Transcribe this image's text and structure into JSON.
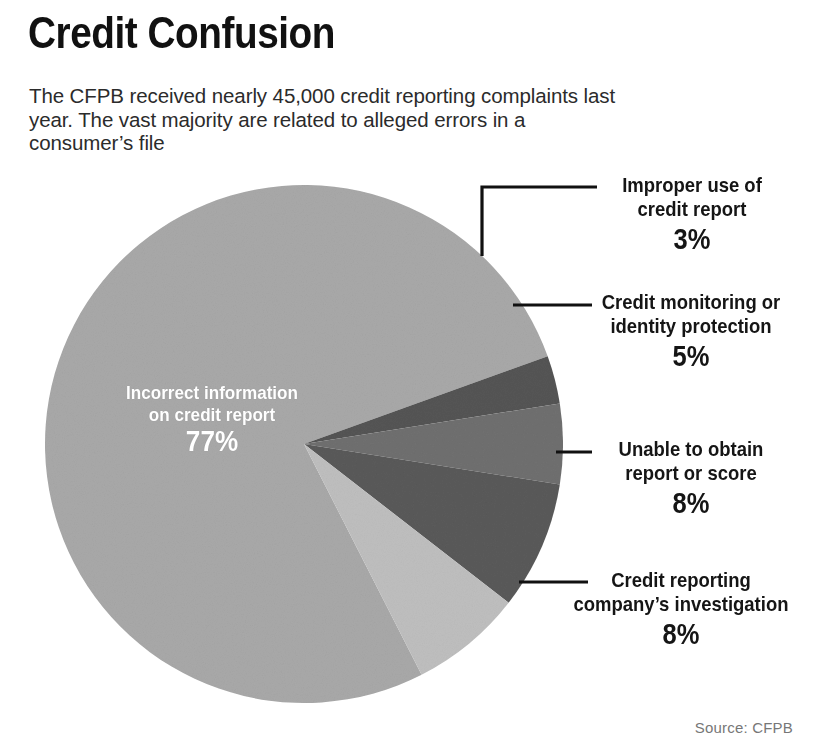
{
  "header": {
    "title": "Credit Confusion",
    "subtitle": "The CFPB received nearly 45,000 credit reporting complaints last year. The vast majority are related to alleged errors in a consumer’s file"
  },
  "source": {
    "label": "Source: CFPB"
  },
  "center_label": {
    "name": "Incorrect information on credit report",
    "value": "77%"
  },
  "callouts": [
    {
      "name": "Improper use of credit report",
      "value": "3%"
    },
    {
      "name": "Credit monitoring or identity protection",
      "value": "5%"
    },
    {
      "name": "Unable to obtain report or score",
      "value": "8%"
    },
    {
      "name": "Credit reporting company’s investigation",
      "value": "8%"
    }
  ],
  "chart_data": {
    "type": "pie",
    "title": "Credit Confusion",
    "subtitle": "The CFPB received nearly 45,000 credit reporting complaints last year. The vast majority are related to alleged errors in a consumer’s file",
    "source": "Source: CFPB",
    "total_complaints": "nearly 45,000",
    "unit": "percent",
    "legend": "none (direct labels with leader lines)",
    "labels": [
      "Incorrect information on credit report",
      "Improper use of credit report",
      "Credit monitoring or identity protection",
      "Unable to obtain report or score",
      "Credit reporting company’s investigation"
    ],
    "values": [
      77,
      3,
      5,
      8,
      8
    ],
    "value_labels": [
      "77%",
      "3%",
      "5%",
      "8%",
      "8%"
    ],
    "colors": [
      "#a9a9a9",
      "#555555",
      "#707070",
      "#5a5a5a",
      "#bfbfbf"
    ],
    "slices": [
      {
        "label": "Incorrect information on credit report",
        "value": 77,
        "value_label": "77%",
        "color": "#a9a9a9",
        "start_deg": 63,
        "end_deg": 340.2,
        "label_placement": "inside",
        "label_color": "#ffffff"
      },
      {
        "label": "Improper use of credit report",
        "value": 3,
        "value_label": "3%",
        "color": "#555555",
        "start_deg": 340.2,
        "end_deg": 351.0,
        "label_placement": "outside-right",
        "leader": "elbow"
      },
      {
        "label": "Credit monitoring or identity protection",
        "value": 5,
        "value_label": "5%",
        "color": "#707070",
        "start_deg": 351.0,
        "end_deg": 9.0,
        "label_placement": "outside-right",
        "leader": "straight"
      },
      {
        "label": "Unable to obtain report or score",
        "value": 8,
        "value_label": "8%",
        "color": "#5a5a5a",
        "start_deg": 9.0,
        "end_deg": 37.8,
        "label_placement": "outside-right",
        "leader": "straight"
      },
      {
        "label": "Credit reporting company’s investigation",
        "value": 8,
        "value_label": "8%",
        "color": "#bfbfbf",
        "start_deg": 37.8,
        "end_deg": 63.0,
        "label_placement": "outside-right",
        "leader": "straight"
      }
    ],
    "geometry": {
      "center_x": 304,
      "center_y": 444,
      "radius": 259
    }
  }
}
